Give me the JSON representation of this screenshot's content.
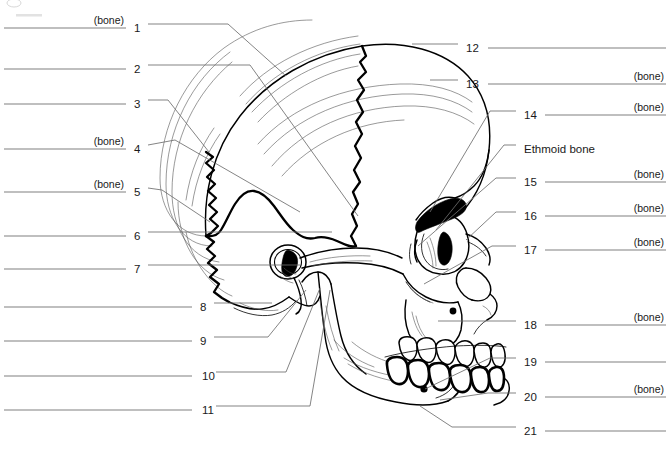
{
  "worksheet": {
    "title": "Skull lateral view labeling worksheet",
    "figure_caption": "",
    "bone_hint": "(bone)"
  },
  "left_labels": [
    {
      "number": "1",
      "bone_hint": "(bone)",
      "y": 24,
      "num_x": 134,
      "line_x1": 4,
      "line_x2": 126
    },
    {
      "number": "2",
      "bone_hint": "",
      "y": 65,
      "num_x": 134,
      "line_x1": 4,
      "line_x2": 126
    },
    {
      "number": "3",
      "bone_hint": "",
      "y": 100,
      "num_x": 134,
      "line_x1": 4,
      "line_x2": 126
    },
    {
      "number": "4",
      "bone_hint": "(bone)",
      "y": 145,
      "num_x": 134,
      "line_x1": 4,
      "line_x2": 126
    },
    {
      "number": "5",
      "bone_hint": "(bone)",
      "y": 188,
      "num_x": 134,
      "line_x1": 4,
      "line_x2": 126
    },
    {
      "number": "6",
      "bone_hint": "",
      "y": 232,
      "num_x": 134,
      "line_x1": 4,
      "line_x2": 126
    },
    {
      "number": "7",
      "bone_hint": "",
      "y": 265,
      "num_x": 134,
      "line_x1": 4,
      "line_x2": 126
    },
    {
      "number": "8",
      "bone_hint": "",
      "y": 303,
      "num_x": 200,
      "line_x1": 4,
      "line_x2": 192
    },
    {
      "number": "9",
      "bone_hint": "",
      "y": 337,
      "num_x": 200,
      "line_x1": 4,
      "line_x2": 192
    },
    {
      "number": "10",
      "bone_hint": "",
      "y": 372,
      "num_x": 202,
      "line_x1": 4,
      "line_x2": 192
    },
    {
      "number": "11",
      "bone_hint": "",
      "y": 406,
      "num_x": 202,
      "line_x1": 4,
      "line_x2": 192
    }
  ],
  "right_labels": [
    {
      "number": "12",
      "bone_hint": "",
      "y": 44,
      "num_x": 466,
      "line_x1": 488,
      "line_x2": 666
    },
    {
      "number": "13",
      "bone_hint": "(bone)",
      "y": 80,
      "num_x": 466,
      "line_x1": 488,
      "line_x2": 666
    },
    {
      "number": "14",
      "bone_hint": "(bone)",
      "y": 111,
      "num_x": 524,
      "line_x1": 545,
      "line_x2": 666
    },
    {
      "number": "Ethmoid bone",
      "bone_hint": "",
      "y": 145,
      "num_x": 524,
      "line_x1": 0,
      "line_x2": 0,
      "is_named": true
    },
    {
      "number": "15",
      "bone_hint": "(bone)",
      "y": 178,
      "num_x": 524,
      "line_x1": 545,
      "line_x2": 666
    },
    {
      "number": "16",
      "bone_hint": "(bone)",
      "y": 212,
      "num_x": 524,
      "line_x1": 545,
      "line_x2": 666
    },
    {
      "number": "17",
      "bone_hint": "(bone)",
      "y": 246,
      "num_x": 524,
      "line_x1": 545,
      "line_x2": 666
    },
    {
      "number": "18",
      "bone_hint": "(bone)",
      "y": 321,
      "num_x": 524,
      "line_x1": 545,
      "line_x2": 666
    },
    {
      "number": "19",
      "bone_hint": "",
      "y": 358,
      "num_x": 524,
      "line_x1": 545,
      "line_x2": 666
    },
    {
      "number": "20",
      "bone_hint": "(bone)",
      "y": 393,
      "num_x": 524,
      "line_x1": 545,
      "line_x2": 666
    },
    {
      "number": "21",
      "bone_hint": "",
      "y": 427,
      "num_x": 524,
      "line_x1": 545,
      "line_x2": 666
    }
  ],
  "diagram": {
    "name": "lateral-skull-diagram",
    "colors": {
      "ink": "#000000",
      "answer_line": "#808080",
      "leader_line": "#6e6e6e",
      "background": "#ffffff"
    }
  }
}
